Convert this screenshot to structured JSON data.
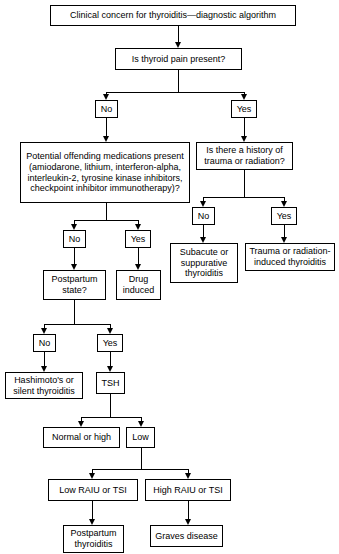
{
  "diagram": {
    "title": "Clinical concern for thyroiditis—diagnostic algorithm",
    "type": "flowchart",
    "nodes": {
      "title_box": "Clinical concern for thyroiditis—diagnostic algorithm",
      "thyroid_pain": "Is thyroid pain present?",
      "pain_no": "No",
      "pain_yes": "Yes",
      "medications": "Potential offending medications present (amiodarone, lithium, interferon-alpha, interleukin-2, tyrosine kinase inhibitors, checkpoint inhibitor immunotherapy)?",
      "trauma_history": "Is there a history of trauma or radiation?",
      "meds_no": "No",
      "meds_yes": "Yes",
      "trauma_no": "No",
      "trauma_yes": "Yes",
      "subacute": "Subacute or suppurative thyroiditis",
      "trauma_induced": "Trauma or radiation-induced thyroiditis",
      "postpartum_state": "Postpartum state?",
      "drug_induced": "Drug induced",
      "pp_no": "No",
      "pp_yes": "Yes",
      "hashimotos": "Hashimoto's or silent thyroiditis",
      "tsh": "TSH",
      "normal_or_high": "Normal or high",
      "low": "Low",
      "low_raiu": "Low RAIU or TSI",
      "high_raiu": "High RAIU or TSI",
      "postpartum_thyroiditis": "Postpartum thyroiditis",
      "graves": "Graves disease"
    },
    "edges": [
      {
        "from": "title_box",
        "to": "thyroid_pain",
        "label": ""
      },
      {
        "from": "thyroid_pain",
        "to": "pain_no",
        "label": "No"
      },
      {
        "from": "thyroid_pain",
        "to": "pain_yes",
        "label": "Yes"
      },
      {
        "from": "pain_no",
        "to": "medications",
        "label": ""
      },
      {
        "from": "pain_yes",
        "to": "trauma_history",
        "label": ""
      },
      {
        "from": "medications",
        "to": "meds_no",
        "label": "No"
      },
      {
        "from": "medications",
        "to": "meds_yes",
        "label": "Yes"
      },
      {
        "from": "trauma_history",
        "to": "trauma_no",
        "label": "No"
      },
      {
        "from": "trauma_history",
        "to": "trauma_yes",
        "label": "Yes"
      },
      {
        "from": "trauma_no",
        "to": "subacute",
        "label": ""
      },
      {
        "from": "trauma_yes",
        "to": "trauma_induced",
        "label": ""
      },
      {
        "from": "meds_no",
        "to": "postpartum_state",
        "label": ""
      },
      {
        "from": "meds_yes",
        "to": "drug_induced",
        "label": ""
      },
      {
        "from": "postpartum_state",
        "to": "pp_no",
        "label": "No"
      },
      {
        "from": "postpartum_state",
        "to": "pp_yes",
        "label": "Yes"
      },
      {
        "from": "pp_no",
        "to": "hashimotos",
        "label": ""
      },
      {
        "from": "pp_yes",
        "to": "tsh",
        "label": ""
      },
      {
        "from": "tsh",
        "to": "normal_or_high",
        "label": ""
      },
      {
        "from": "tsh",
        "to": "low",
        "label": ""
      },
      {
        "from": "low",
        "to": "low_raiu",
        "label": ""
      },
      {
        "from": "low",
        "to": "high_raiu",
        "label": ""
      },
      {
        "from": "low_raiu",
        "to": "postpartum_thyroiditis",
        "label": ""
      },
      {
        "from": "high_raiu",
        "to": "graves",
        "label": ""
      }
    ],
    "colors": {
      "background": "#ffffff",
      "border": "#000000",
      "text": "#000000"
    }
  }
}
